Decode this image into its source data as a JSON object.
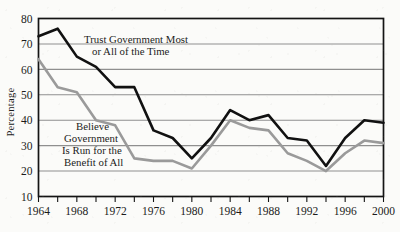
{
  "chart_data": {
    "type": "line",
    "title": "",
    "subtitle": "",
    "xlabel": "",
    "ylabel": "Percentage",
    "xlim": [
      1964,
      2000
    ],
    "ylim": [
      10,
      80
    ],
    "grid": true,
    "grid_axis": "y",
    "legend_position": "inline-annotation",
    "y_ticks": [
      10,
      20,
      30,
      40,
      50,
      60,
      70,
      80
    ],
    "y_tick_labels": [
      "10",
      "20",
      "30",
      "40",
      "50",
      "60",
      "70",
      "80"
    ],
    "x_ticks": [
      1964,
      1966,
      1968,
      1970,
      1972,
      1974,
      1976,
      1978,
      1980,
      1982,
      1984,
      1986,
      1988,
      1990,
      1992,
      1994,
      1996,
      1998,
      2000
    ],
    "x_tick_labels": [
      "1964",
      "",
      "1968",
      "",
      "1972",
      "",
      "1976",
      "",
      "1980",
      "",
      "1984",
      "",
      "1988",
      "",
      "1992",
      "",
      "1996",
      "",
      "2000"
    ],
    "x_labeled_ticks": [
      1964,
      1968,
      1972,
      1976,
      1980,
      1984,
      1988,
      1992,
      1996,
      2000
    ],
    "series": [
      {
        "name": "Trust Government Most or All of the Time",
        "color": "#111111",
        "width": 2.6,
        "annotation": "Trust Government Most\nor All of the Time",
        "annotation_line1": "Trust Government Most",
        "annotation_line2": "or All of the Time",
        "x": [
          1964,
          1966,
          1968,
          1970,
          1972,
          1974,
          1976,
          1978,
          1980,
          1982,
          1984,
          1986,
          1988,
          1990,
          1992,
          1994,
          1996,
          1998,
          2000
        ],
        "values": [
          73,
          76,
          65,
          61,
          53,
          53,
          36,
          33,
          25,
          33,
          44,
          40,
          42,
          33,
          32,
          22,
          33,
          40,
          39
        ]
      },
      {
        "name": "Believe Government Is Run for the Benefit of All",
        "color": "#9a9a9a",
        "width": 2.6,
        "annotation": "Believe\nGovernment\nIs Run for the\nBenefit of All",
        "annotation_line1": "Believe",
        "annotation_line2": "Government",
        "annotation_line3": "Is Run for the",
        "annotation_line4": "Benefit of All",
        "x": [
          1964,
          1966,
          1968,
          1970,
          1972,
          1974,
          1976,
          1978,
          1980,
          1982,
          1984,
          1986,
          1988,
          1990,
          1992,
          1994,
          1996,
          1998,
          2000
        ],
        "values": [
          64,
          53,
          51,
          40,
          38,
          25,
          24,
          24,
          21,
          30,
          40,
          37,
          36,
          27,
          24,
          20,
          27,
          32,
          31
        ]
      }
    ],
    "colors": {
      "series_black": "#111111",
      "series_gray": "#9a9a9a",
      "gridline": "#8f8f8f",
      "axis": "#141414",
      "background": "#fbfbf9",
      "text": "#1b1b1b"
    }
  },
  "axes": {
    "y_label": "Percentage"
  }
}
